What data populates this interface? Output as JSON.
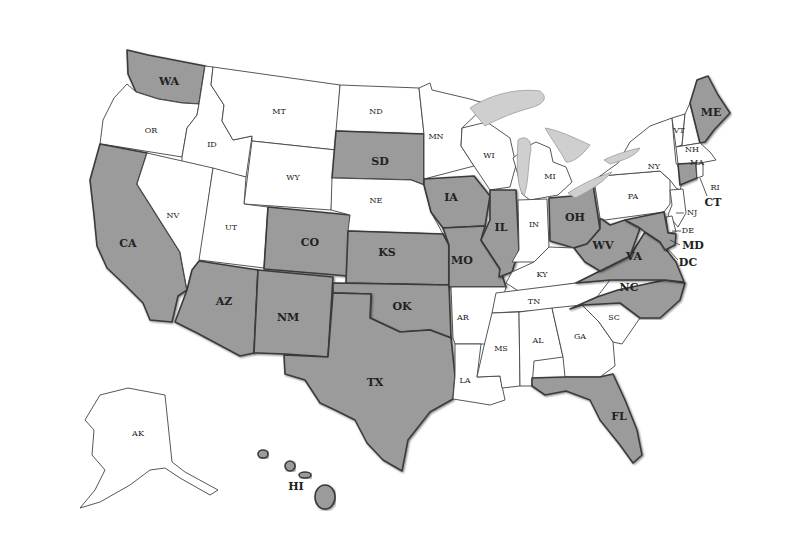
{
  "map": {
    "title": "",
    "shade_colors": {
      "shaded": "#9b9b9b",
      "unshaded": "#ffffff",
      "lakes": "#cfcfcf"
    },
    "states": [
      {
        "code": "WA",
        "shaded": true
      },
      {
        "code": "OR",
        "shaded": false
      },
      {
        "code": "CA",
        "shaded": true
      },
      {
        "code": "ID",
        "shaded": false
      },
      {
        "code": "NV",
        "shaded": false
      },
      {
        "code": "MT",
        "shaded": false
      },
      {
        "code": "WY",
        "shaded": false
      },
      {
        "code": "UT",
        "shaded": false
      },
      {
        "code": "AZ",
        "shaded": true
      },
      {
        "code": "CO",
        "shaded": true
      },
      {
        "code": "NM",
        "shaded": true
      },
      {
        "code": "ND",
        "shaded": false
      },
      {
        "code": "SD",
        "shaded": true
      },
      {
        "code": "NE",
        "shaded": false
      },
      {
        "code": "KS",
        "shaded": true
      },
      {
        "code": "OK",
        "shaded": true
      },
      {
        "code": "TX",
        "shaded": true
      },
      {
        "code": "MN",
        "shaded": false
      },
      {
        "code": "IA",
        "shaded": true
      },
      {
        "code": "MO",
        "shaded": true
      },
      {
        "code": "AR",
        "shaded": false
      },
      {
        "code": "LA",
        "shaded": false
      },
      {
        "code": "WI",
        "shaded": false
      },
      {
        "code": "IL",
        "shaded": true
      },
      {
        "code": "MI",
        "shaded": false
      },
      {
        "code": "IN",
        "shaded": false
      },
      {
        "code": "OH",
        "shaded": true
      },
      {
        "code": "KY",
        "shaded": false
      },
      {
        "code": "TN",
        "shaded": false
      },
      {
        "code": "MS",
        "shaded": false
      },
      {
        "code": "AL",
        "shaded": false
      },
      {
        "code": "GA",
        "shaded": false
      },
      {
        "code": "FL",
        "shaded": true
      },
      {
        "code": "SC",
        "shaded": false
      },
      {
        "code": "NC",
        "shaded": true
      },
      {
        "code": "VA",
        "shaded": true
      },
      {
        "code": "WV",
        "shaded": true
      },
      {
        "code": "PA",
        "shaded": false
      },
      {
        "code": "NY",
        "shaded": false
      },
      {
        "code": "VT",
        "shaded": false
      },
      {
        "code": "NH",
        "shaded": false
      },
      {
        "code": "ME",
        "shaded": true
      },
      {
        "code": "MA",
        "shaded": false
      },
      {
        "code": "RI",
        "shaded": false
      },
      {
        "code": "CT",
        "shaded": true
      },
      {
        "code": "NJ",
        "shaded": false
      },
      {
        "code": "DE",
        "shaded": false
      },
      {
        "code": "MD",
        "shaded": true
      },
      {
        "code": "DC",
        "shaded": true
      },
      {
        "code": "AK",
        "shaded": false
      },
      {
        "code": "HI",
        "shaded": true
      }
    ],
    "labels": {
      "WA": "WA",
      "OR": "OR",
      "CA": "CA",
      "ID": "ID",
      "NV": "NV",
      "MT": "MT",
      "WY": "WY",
      "UT": "UT",
      "AZ": "AZ",
      "CO": "CO",
      "NM": "NM",
      "ND": "ND",
      "SD": "SD",
      "NE": "NE",
      "KS": "KS",
      "OK": "OK",
      "TX": "TX",
      "MN": "MN",
      "IA": "IA",
      "MO": "MO",
      "AR": "AR",
      "LA": "LA",
      "WI": "WI",
      "IL": "IL",
      "MI": "MI",
      "IN": "IN",
      "OH": "OH",
      "KY": "KY",
      "TN": "TN",
      "MS": "MS",
      "AL": "AL",
      "GA": "GA",
      "FL": "FL",
      "SC": "SC",
      "NC": "NC",
      "VA": "VA",
      "WV": "WV",
      "PA": "PA",
      "NY": "NY",
      "VT": "VT",
      "NH": "NH",
      "ME": "ME",
      "MA": "MA",
      "RI": "RI",
      "CT": "CT",
      "NJ": "NJ",
      "DE": "DE",
      "MD": "MD",
      "DC": "DC",
      "AK": "AK",
      "HI": "HI"
    }
  }
}
